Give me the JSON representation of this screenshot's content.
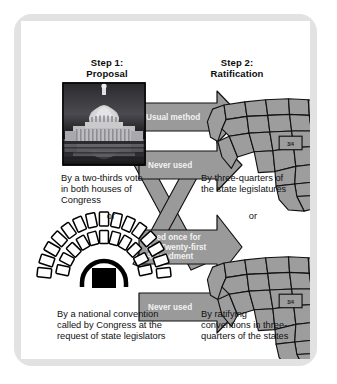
{
  "diagram": {
    "title_step1": "Step 1:\nProposal",
    "title_step2": "Step 2:\nRatification",
    "step1_line1": "Step 1:",
    "step1_line2": "Proposal",
    "step2_line1": "Step 2:",
    "step2_line2": "Ratification",
    "or_left": "or",
    "or_right": "or"
  },
  "proposal": {
    "photo_caption_l1": "By a two-thirds vote",
    "photo_caption_l2": "in both houses of",
    "photo_caption_l3": "Congress",
    "photo_alt": "capitol-building-photo",
    "convention_caption_l1": "By a national convention",
    "convention_caption_l2": "called by Congress at the",
    "convention_caption_l3": "request of state legislators",
    "convention_alt": "convention-seating-icon"
  },
  "ratification": {
    "map1_caption_l1": "By three-quarters of",
    "map1_caption_l2": "the state legislatures",
    "map2_caption_l1": "By ratifying",
    "map2_caption_l2": "conventions in three-",
    "map2_caption_l3": "quarters of the states",
    "map1_fraction": "3/4",
    "map2_fraction": "3/4"
  },
  "arrows": [
    {
      "id": "usual-method",
      "label": "Usual method",
      "lines": [
        "Usual method"
      ]
    },
    {
      "id": "never-used-top",
      "label": "Never used",
      "lines": [
        "Never used"
      ]
    },
    {
      "id": "used-once",
      "label": "Used once for the Twenty-first Amendment",
      "lines": [
        "Used once for",
        "the Twenty-first",
        "Amendment"
      ]
    },
    {
      "id": "never-used-bottom",
      "label": "Never used",
      "lines": [
        "Never used"
      ]
    }
  ],
  "colors": {
    "frame": "#e2e2e2",
    "arrow_fill": "#9a9a9a",
    "arrow_stroke": "#111111",
    "arrow_text": "#f2f2f2",
    "map_fill": "#9d9d9d",
    "map_stroke": "#111111",
    "text": "#111111",
    "background": "#ffffff"
  }
}
